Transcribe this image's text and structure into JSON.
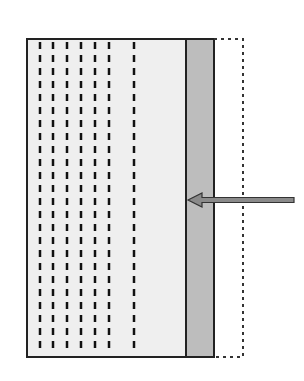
{
  "diagram": {
    "type": "schematic-block",
    "background": "#ffffff",
    "main_block": {
      "x": 27,
      "y": 39,
      "width": 159,
      "height": 318,
      "fill": "#efefef",
      "stroke": "#222222"
    },
    "dashed_lines": {
      "x_positions": [
        40,
        53,
        67,
        81,
        95,
        109,
        134
      ],
      "y_start": 42,
      "y_end": 350,
      "color": "#111111",
      "dash": "7 6"
    },
    "gray_layer": {
      "x": 186,
      "y": 39,
      "width": 28,
      "height": 318,
      "fill": "#bdbdbd",
      "stroke": "#222222"
    },
    "dotted_extension": {
      "x": 214,
      "y": 39,
      "width": 29,
      "height": 318,
      "stroke": "#333333",
      "dash": "3 4"
    },
    "arrow": {
      "from_x": 294,
      "to_x": 188,
      "y": 200,
      "fill": "#8a8a8a",
      "stroke": "#333333",
      "direction": "left"
    }
  }
}
